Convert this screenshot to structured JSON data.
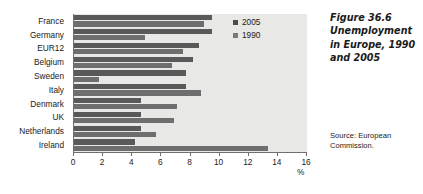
{
  "figure": {
    "title": "Figure 36.6 Unemployment in Europe, 1990 and 2005",
    "source": "Source: European Commission."
  },
  "legend": {
    "items": [
      {
        "label": "2005",
        "color": "#4d4d4d"
      },
      {
        "label": "1990",
        "color": "#7a7a7a"
      }
    ]
  },
  "axis": {
    "unit": "%",
    "tick_labels": [
      "0",
      "2",
      "4",
      "6",
      "8",
      "10",
      "12",
      "14",
      "16"
    ]
  },
  "chart_data": {
    "type": "bar",
    "orientation": "horizontal",
    "title": "Figure 36.6 Unemployment in Europe, 1990 and 2005",
    "xlabel": "%",
    "ylabel": "",
    "xlim": [
      0,
      16
    ],
    "xticks": [
      0,
      2,
      4,
      6,
      8,
      10,
      12,
      14,
      16
    ],
    "grid": false,
    "legend_position": "top-right",
    "source": "Source: European Commission.",
    "categories": [
      "France",
      "Germany",
      "EUR12",
      "Belgium",
      "Sweden",
      "Italy",
      "Denmark",
      "UK",
      "Netherlands",
      "Ireland"
    ],
    "series": [
      {
        "name": "2005",
        "color": "#595959",
        "values": [
          9.5,
          9.5,
          8.6,
          8.2,
          7.7,
          7.7,
          4.6,
          4.6,
          4.6,
          4.2
        ]
      },
      {
        "name": "1990",
        "color": "#6e6e6e",
        "values": [
          8.9,
          4.9,
          7.5,
          6.7,
          1.7,
          8.7,
          7.1,
          6.9,
          5.6,
          13.3
        ]
      }
    ]
  }
}
